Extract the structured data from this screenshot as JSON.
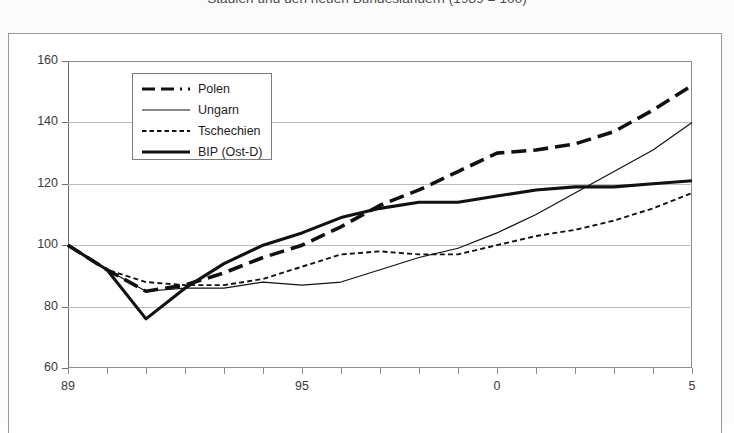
{
  "title": "Stadien und den neuen Bundesländern  (1989 = 100)",
  "chart_data": {
    "type": "line",
    "title": "Stadien und den neuen Bundesländern  (1989 = 100)",
    "xlabel": "",
    "ylabel": "",
    "xlim": [
      1989,
      2005
    ],
    "ylim": [
      60,
      160
    ],
    "grid": true,
    "legend_position": "inside-upper-left",
    "y_ticks": [
      60,
      80,
      100,
      120,
      140,
      160
    ],
    "x_ticks": [
      1989,
      1990,
      1991,
      1992,
      1993,
      1994,
      1995,
      1996,
      1997,
      1998,
      1999,
      2000,
      2001,
      2002,
      2003,
      2004,
      2005
    ],
    "x_tick_labels": [
      "89",
      "",
      "",
      "",
      "",
      "",
      "95",
      "",
      "",
      "",
      "",
      "0",
      "",
      "",
      "",
      "",
      "5"
    ],
    "x": [
      1989,
      1990,
      1991,
      1992,
      1993,
      1994,
      1995,
      1996,
      1997,
      1998,
      1999,
      2000,
      2001,
      2002,
      2003,
      2004,
      2005
    ],
    "series": [
      {
        "name": "Polen",
        "style": "thick-dashed",
        "color": "#111111",
        "values": [
          100,
          92,
          85,
          87,
          91,
          96,
          100,
          106,
          113,
          118,
          124,
          130,
          131,
          133,
          137,
          144,
          152
        ]
      },
      {
        "name": "Ungarn",
        "style": "thin-solid",
        "color": "#111111",
        "values": [
          100,
          92,
          85,
          86,
          86,
          88,
          87,
          88,
          92,
          96,
          99,
          104,
          110,
          117,
          124,
          131,
          140
        ]
      },
      {
        "name": "Tschechien",
        "style": "fine-dashed",
        "color": "#111111",
        "values": [
          100,
          92,
          88,
          87,
          87,
          89,
          93,
          97,
          98,
          97,
          97,
          100,
          103,
          105,
          108,
          112,
          117
        ]
      },
      {
        "name": "BIP (Ost-D)",
        "style": "thick-solid",
        "color": "#111111",
        "values": [
          100,
          92,
          76,
          86,
          94,
          100,
          104,
          109,
          112,
          114,
          114,
          116,
          118,
          119,
          119,
          120,
          121
        ]
      }
    ]
  },
  "axes": {
    "y_labels": [
      "160",
      "140",
      "120",
      "100",
      "80",
      "60"
    ],
    "x_labels": [
      "89",
      "95",
      "0",
      "5"
    ]
  },
  "legend": {
    "items": [
      {
        "label": "Polen",
        "swatch": "thick-dashed-line-icon"
      },
      {
        "label": "Ungarn",
        "swatch": "thin-solid-line-icon"
      },
      {
        "label": "Tschechien",
        "swatch": "fine-dashed-line-icon"
      },
      {
        "label": "BIP (Ost-D)",
        "swatch": "thick-solid-line-icon"
      }
    ]
  }
}
